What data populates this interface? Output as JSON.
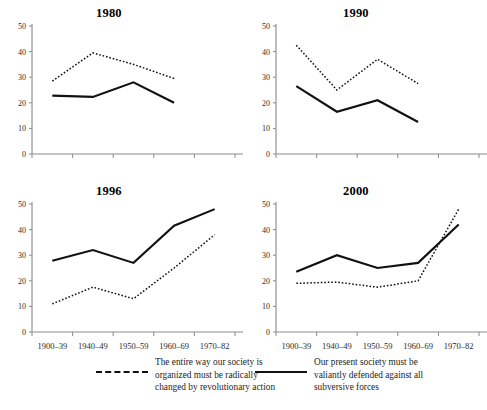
{
  "figure": {
    "panel_titles": [
      "1980",
      "1990",
      "1996",
      "2000"
    ],
    "legend": {
      "entries": [
        {
          "style": "dashed",
          "label": "The entire way our society is\norganized must be radically\nchanged by revolutionary action"
        },
        {
          "style": "solid",
          "label": "Our present society must be\nvaliantly defended against all\nsubversive forces"
        }
      ]
    }
  },
  "axes": {
    "yticks": [
      "50",
      "40",
      "30",
      "20",
      "10",
      "0"
    ],
    "xticks": [
      "1900–39",
      "1940–49",
      "1950–59",
      "1960–69",
      "1970–82"
    ]
  },
  "colors": {
    "line": "#111111",
    "axis": "#8a8a8a",
    "text": "#1d1d1d",
    "background": "#ffffff"
  },
  "chart_data": [
    {
      "type": "line",
      "title": "1980",
      "xlabel": "",
      "ylabel": "",
      "ylim": [
        0,
        50
      ],
      "grid": false,
      "legend_position": "below-figure",
      "categories": [
        "1900–39",
        "1940–49",
        "1950–59",
        "1960–69",
        "1970–82"
      ],
      "series": [
        {
          "name": "The entire way our society is organized must be radically changed by revolutionary action",
          "style": "dotted",
          "values": [
            28.5,
            39.5,
            35.0,
            29.5,
            null
          ]
        },
        {
          "name": "Our present society must be valiantly defended against all subversive forces",
          "style": "solid",
          "values": [
            22.8,
            22.3,
            28.0,
            20.0,
            null
          ]
        }
      ]
    },
    {
      "type": "line",
      "title": "1990",
      "xlabel": "",
      "ylabel": "",
      "ylim": [
        0,
        50
      ],
      "grid": false,
      "legend_position": "below-figure",
      "categories": [
        "1900–39",
        "1940–49",
        "1950–59",
        "1960–69",
        "1970–82"
      ],
      "series": [
        {
          "name": "The entire way our society is organized must be radically changed by revolutionary action",
          "style": "dotted",
          "values": [
            42.5,
            25.0,
            37.0,
            27.5,
            null
          ]
        },
        {
          "name": "Our present society must be valiantly defended against all subversive forces",
          "style": "solid",
          "values": [
            26.5,
            16.5,
            21.0,
            12.5,
            null
          ]
        }
      ]
    },
    {
      "type": "line",
      "title": "1996",
      "xlabel": "",
      "ylabel": "",
      "ylim": [
        0,
        50
      ],
      "grid": false,
      "legend_position": "below-figure",
      "categories": [
        "1900–39",
        "1940–49",
        "1950–59",
        "1960–69",
        "1970–82"
      ],
      "series": [
        {
          "name": "The entire way our society is organized must be radically changed by revolutionary action",
          "style": "dotted",
          "values": [
            11.0,
            17.5,
            13.0,
            25.0,
            38.0
          ]
        },
        {
          "name": "Our present society must be valiantly defended against all subversive forces",
          "style": "solid",
          "values": [
            27.8,
            32.0,
            27.0,
            41.5,
            48.0
          ]
        }
      ]
    },
    {
      "type": "line",
      "title": "2000",
      "xlabel": "",
      "ylabel": "",
      "ylim": [
        0,
        50
      ],
      "grid": false,
      "legend_position": "below-figure",
      "categories": [
        "1900–39",
        "1940–49",
        "1950–59",
        "1960–69",
        "1970–82"
      ],
      "series": [
        {
          "name": "The entire way our society is organized must be radically changed by revolutionary action",
          "style": "dotted",
          "values": [
            19.0,
            19.5,
            17.5,
            20.0,
            48.0
          ]
        },
        {
          "name": "Our present society must be valiantly defended against all subversive forces",
          "style": "solid",
          "values": [
            23.5,
            30.0,
            25.0,
            27.0,
            42.0
          ]
        }
      ]
    }
  ]
}
